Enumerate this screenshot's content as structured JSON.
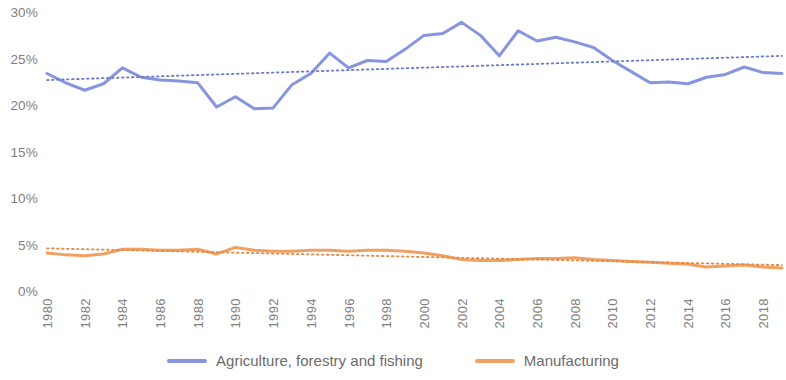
{
  "chart_data": {
    "type": "line",
    "title": "",
    "subtitle": "",
    "xlabel": "",
    "ylabel": "",
    "grid": false,
    "legend_position": "bottom",
    "ylim": [
      0,
      30
    ],
    "xlim": [
      1980,
      2019
    ],
    "y_ticks": [
      0,
      5,
      10,
      15,
      20,
      25,
      30
    ],
    "y_tick_labels": [
      "0%",
      "5%",
      "10%",
      "15%",
      "20%",
      "25%",
      "30%"
    ],
    "x_ticks": [
      1980,
      1982,
      1984,
      1986,
      1988,
      1990,
      1992,
      1994,
      1996,
      1998,
      2000,
      2002,
      2004,
      2006,
      2008,
      2010,
      2012,
      2014,
      2016,
      2018
    ],
    "x_tick_labels": [
      "1980",
      "1982",
      "1984",
      "1986",
      "1988",
      "1990",
      "1992",
      "1994",
      "1996",
      "1998",
      "2000",
      "2002",
      "2004",
      "2006",
      "2008",
      "2010",
      "2012",
      "2014",
      "2016",
      "2018"
    ],
    "x": [
      1980,
      1981,
      1982,
      1983,
      1984,
      1985,
      1986,
      1987,
      1988,
      1989,
      1990,
      1991,
      1992,
      1993,
      1994,
      1995,
      1996,
      1997,
      1998,
      1999,
      2000,
      2001,
      2002,
      2003,
      2004,
      2005,
      2006,
      2007,
      2008,
      2009,
      2010,
      2011,
      2012,
      2013,
      2014,
      2015,
      2016,
      2017,
      2018,
      2019
    ],
    "series": [
      {
        "name": "Agriculture, forestry and fishing",
        "color": "#8795E0",
        "values": [
          23.6,
          22.6,
          21.8,
          22.5,
          24.2,
          23.2,
          22.9,
          22.8,
          22.6,
          20.0,
          21.1,
          19.8,
          19.9,
          22.4,
          23.6,
          25.8,
          24.2,
          25.0,
          24.9,
          26.2,
          27.7,
          27.9,
          29.1,
          27.7,
          25.5,
          28.2,
          27.1,
          27.5,
          27.0,
          26.4,
          25.0,
          23.8,
          22.6,
          22.7,
          22.5,
          23.2,
          23.5,
          24.3,
          23.7,
          23.6
        ],
        "trendline": {
          "name": "Linear trend (Agriculture, forestry and fishing)",
          "style": "dotted",
          "color": "#6b7ac9",
          "start_value": 22.9,
          "end_value": 25.5
        }
      },
      {
        "name": "Manufacturing",
        "color": "#F0A060",
        "values": [
          4.3,
          4.1,
          4.0,
          4.2,
          4.7,
          4.7,
          4.6,
          4.6,
          4.7,
          4.2,
          4.9,
          4.6,
          4.5,
          4.5,
          4.6,
          4.6,
          4.5,
          4.6,
          4.6,
          4.5,
          4.3,
          4.0,
          3.6,
          3.5,
          3.5,
          3.6,
          3.7,
          3.7,
          3.8,
          3.6,
          3.5,
          3.4,
          3.3,
          3.2,
          3.1,
          2.8,
          2.9,
          3.0,
          2.8,
          2.7
        ],
        "trendline": {
          "name": "Linear trend (Manufacturing)",
          "style": "dotted",
          "color": "#e08a45",
          "start_value": 4.8,
          "end_value": 3.0
        }
      }
    ],
    "legend": [
      {
        "label": "Agriculture, forestry and fishing",
        "color": "#8795E0"
      },
      {
        "label": "Manufacturing",
        "color": "#F0A060"
      }
    ]
  },
  "legend": {
    "items": [
      {
        "label": "Agriculture, forestry and fishing"
      },
      {
        "label": "Manufacturing"
      }
    ]
  }
}
